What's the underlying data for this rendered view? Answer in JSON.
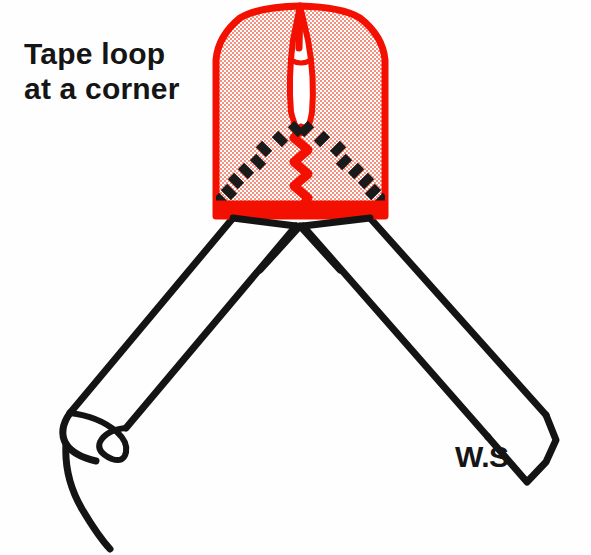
{
  "figure": {
    "title": "Tape loop at a corner",
    "type": "sewing-technique-illustration",
    "background_color": "#fefefe",
    "caption": {
      "lines": [
        "Tape loop",
        "at a corner"
      ],
      "color": "#151515"
    },
    "annotations": {
      "wrong_side_label": "W.S."
    },
    "colors": {
      "tape_outline_red": "#f41000",
      "tape_fill_pink": "#f7b9ad",
      "stitch_black": "#1a1a1a",
      "band_outline_black": "#141414",
      "background": "#fefefe"
    },
    "elements": {
      "tape_panel": {
        "name": "red-tape-panel",
        "description": "Shaded red tape panel with rounded top corners",
        "bounds": {
          "x": 212,
          "y": 4,
          "width": 178,
          "height": 212
        }
      },
      "tape_loop_opening": {
        "name": "tape-loop-slit",
        "description": "Narrow leaf-shaped loop opening at panel centre"
      },
      "chevron_stitches": {
        "name": "black-basting-chevron",
        "description": "Black dash stitches forming a V at the mitred corner",
        "left_dash_count": 9,
        "right_dash_count": 9
      },
      "centre_seam": {
        "name": "red-centre-seam",
        "description": "Red zigzag stitching running down panel centre"
      },
      "hem_seam": {
        "name": "red-hem-seam",
        "description": "Red scalloped stitch band along panel lower edge"
      },
      "left_band": {
        "name": "left-fabric-band",
        "description": "Fabric band running down-left with rolled raw end"
      },
      "right_band": {
        "name": "right-fabric-band",
        "description": "Fabric band running down-right with angled cut end"
      }
    }
  }
}
